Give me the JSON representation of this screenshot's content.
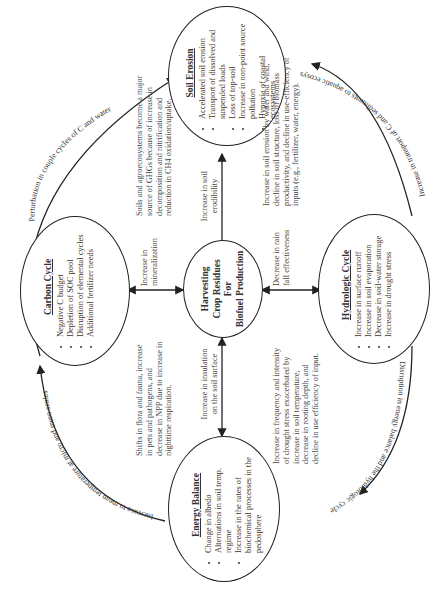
{
  "center": {
    "lines": [
      "Harvesting",
      "Crop Residues",
      "For",
      "Biofuel Production"
    ]
  },
  "nodes": {
    "soil_erosion": {
      "title": "Soil Erosion",
      "items": [
        "Accelerated soil erosion",
        "Transport of dissolved and suspended loads",
        "Loss of top-soil",
        "Increase in non-point source pollution",
        "Hypoxia of coastal ecosystems"
      ]
    },
    "carbon_cycle": {
      "title": "Carbon Cycle",
      "items": [
        "Negative C budget",
        "Depletion of SOC pool",
        "Disruption of elemental cycles",
        "Additional fertilizer needs"
      ]
    },
    "hydrologic_cycle": {
      "title": "Hydrologic Cycle",
      "items": [
        "Increase in surface runoff",
        "Increase in soil evaporation",
        "Decrease in soil-water storage",
        "Increase in drought stress"
      ]
    },
    "energy_balance": {
      "title": "Energy Balance",
      "items": [
        "Change in albedo",
        "Alternations in soil temp. regime",
        "Increase in the rates of biochemical processes in the pedosphere"
      ]
    }
  },
  "center_edges": {
    "to_soil_erosion": "Increase in soil erodibility",
    "to_carbon_cycle": "Increase in mineralization",
    "to_hydrologic_cycle": "Decrease in rain fall effectiveness",
    "to_energy_balance": "Increase in insulation on the soil surface"
  },
  "notes": {
    "carbon_soil": "Soils and agroecosystems become a major source of GHGs because of increase in decomposition and nitrification and reduction in CH4 oxidation/uptake.",
    "hydro_soil": "Increase in soil erosion by water and wind, decline in soil structure, loss of biomass productivity, and decline in use-efficiency of inputs (e.g., fertilizer, water, energy).",
    "carbon_energy": "Shifts in flora and fauna, increase in pets and pathogens, and decrease in NPP due to increase in nighttime respiration.",
    "hydro_energy": "Increase in frequency and intensity of drought stress exacerbated by increase in soil temperature, decrease in rooting depth, and decline in use efficiency of input."
  },
  "outer_arcs": {
    "carbon_to_soil": "Perturbation in couple cycles of C and water",
    "hydro_to_soil": "Increase in transport of C and sediments to aquatic ecosystems",
    "energy_to_carbon": "Increase to mean temperature at micro and meso scales",
    "hydro_to_energy": "Disruption in energy balance and the hydrologic cycle"
  }
}
